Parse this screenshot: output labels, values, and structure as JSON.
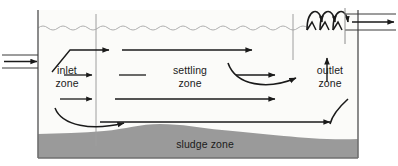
{
  "diagram": {
    "type": "sedimentation-tank-cross-section",
    "zones": [
      {
        "id": "inlet",
        "label": "inlet\nzone"
      },
      {
        "id": "settling",
        "label": "settling\nzone"
      },
      {
        "id": "outlet",
        "label": "outlet\nzone"
      },
      {
        "id": "sludge",
        "label": "sludge zone"
      }
    ],
    "colors": {
      "stroke": "#1a1a1a",
      "sludge_fill": "#9a9a9a",
      "tank_fill": "#fbfbf9",
      "divider": "#9e9e9e",
      "water_surface": "#b0b0b0",
      "border": "#8c8c8c",
      "background": "#ffffff"
    },
    "flow_arrows": {
      "inlet_pipe": "arrow-right",
      "outlet_pipe": "arrow-right",
      "settling_upper": "arrow-right",
      "settling_middle": "arrow-right",
      "settling_lower": "arrow-right",
      "sludge_flow": "arrow-right",
      "inlet_deflector": "arrow-up-right",
      "outlet_riser": "arrow-up",
      "recirculation": "arrow-curve",
      "weir_overflow": "arrow-curve-over"
    }
  }
}
